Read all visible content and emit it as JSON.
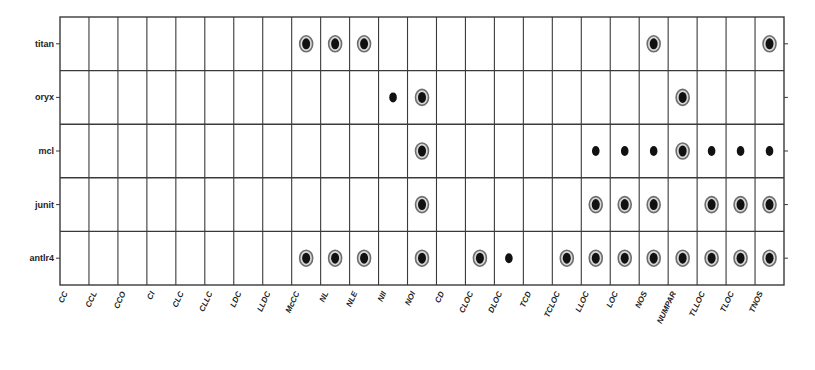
{
  "chart_data": {
    "type": "scatter",
    "title": "",
    "xlabel": "",
    "ylabel": "",
    "grid": true,
    "legend": null,
    "categories": [
      "CC",
      "CCL",
      "CCO",
      "CI",
      "CLC",
      "CLLC",
      "LDC",
      "LLDC",
      "McCC",
      "NL",
      "NLE",
      "NII",
      "NOI",
      "CD",
      "CLOC",
      "DLOC",
      "TCD",
      "TCLOC",
      "LLOC",
      "LOC",
      "NOS",
      "NUMPAR",
      "TLLOC",
      "TLOC",
      "TNOS"
    ],
    "rows": [
      "titan",
      "oryx",
      "mcl",
      "junit",
      "antlr4"
    ],
    "marker_types": {
      "ring": "filled dot with surrounding ring",
      "dot": "small filled dot"
    },
    "series": [
      {
        "name": "titan",
        "points": [
          {
            "x": "McCC",
            "marker": "ring"
          },
          {
            "x": "NL",
            "marker": "ring"
          },
          {
            "x": "NLE",
            "marker": "ring"
          },
          {
            "x": "NOS",
            "marker": "ring"
          },
          {
            "x": "TNOS",
            "marker": "ring"
          }
        ]
      },
      {
        "name": "oryx",
        "points": [
          {
            "x": "NII",
            "marker": "dot"
          },
          {
            "x": "NOI",
            "marker": "ring"
          },
          {
            "x": "NUMPAR",
            "marker": "ring"
          }
        ]
      },
      {
        "name": "mcl",
        "points": [
          {
            "x": "NOI",
            "marker": "ring"
          },
          {
            "x": "LLOC",
            "marker": "dot"
          },
          {
            "x": "LOC",
            "marker": "dot"
          },
          {
            "x": "NOS",
            "marker": "dot"
          },
          {
            "x": "NUMPAR",
            "marker": "ring"
          },
          {
            "x": "TLLOC",
            "marker": "dot"
          },
          {
            "x": "TLOC",
            "marker": "dot"
          },
          {
            "x": "TNOS",
            "marker": "dot"
          }
        ]
      },
      {
        "name": "junit",
        "points": [
          {
            "x": "NOI",
            "marker": "ring"
          },
          {
            "x": "LLOC",
            "marker": "ring"
          },
          {
            "x": "LOC",
            "marker": "ring"
          },
          {
            "x": "NOS",
            "marker": "ring"
          },
          {
            "x": "TLLOC",
            "marker": "ring"
          },
          {
            "x": "TLOC",
            "marker": "ring"
          },
          {
            "x": "TNOS",
            "marker": "ring"
          }
        ]
      },
      {
        "name": "antlr4",
        "points": [
          {
            "x": "McCC",
            "marker": "ring"
          },
          {
            "x": "NL",
            "marker": "ring"
          },
          {
            "x": "NLE",
            "marker": "ring"
          },
          {
            "x": "NOI",
            "marker": "ring"
          },
          {
            "x": "CLOC",
            "marker": "ring"
          },
          {
            "x": "DLOC",
            "marker": "dot"
          },
          {
            "x": "TCLOC",
            "marker": "ring"
          },
          {
            "x": "LLOC",
            "marker": "ring"
          },
          {
            "x": "LOC",
            "marker": "ring"
          },
          {
            "x": "NOS",
            "marker": "ring"
          },
          {
            "x": "NUMPAR",
            "marker": "ring"
          },
          {
            "x": "TLLOC",
            "marker": "ring"
          },
          {
            "x": "TLOC",
            "marker": "ring"
          },
          {
            "x": "TNOS",
            "marker": "ring"
          }
        ]
      }
    ],
    "colors": {
      "grid": "#3a3a3a",
      "marker_fill": "#111111",
      "ring": "#6e6e6e"
    }
  }
}
